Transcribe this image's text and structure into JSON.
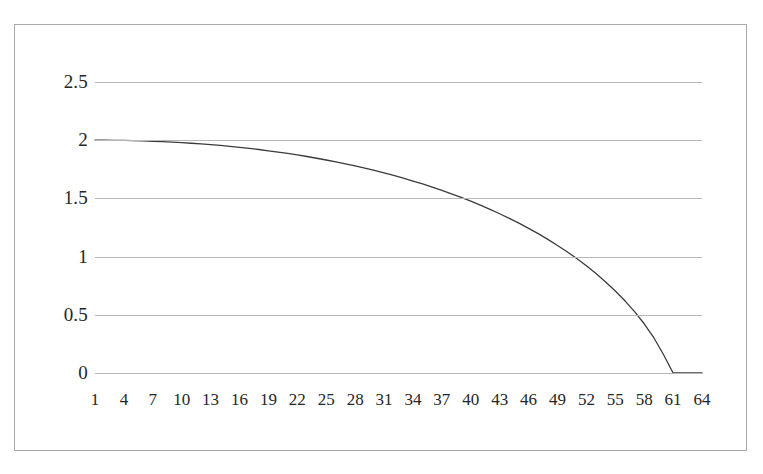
{
  "chart_data": {
    "type": "line",
    "title": "",
    "subtitle": "",
    "xlabel": "",
    "ylabel": "",
    "grid": true,
    "legend": false,
    "legend_position": "none",
    "xlim": [
      1,
      64
    ],
    "ylim": [
      0,
      2.5
    ],
    "y_ticks": [
      "2.5",
      "2",
      "1.5",
      "1",
      "0.5",
      "0"
    ],
    "y_tick_values": [
      2.5,
      2,
      1.5,
      1,
      0.5,
      0
    ],
    "x_ticks": [
      "1",
      "4",
      "7",
      "10",
      "13",
      "16",
      "19",
      "22",
      "25",
      "28",
      "31",
      "34",
      "37",
      "40",
      "43",
      "46",
      "49",
      "52",
      "55",
      "58",
      "61",
      "64"
    ],
    "x_tick_values": [
      1,
      4,
      7,
      10,
      13,
      16,
      19,
      22,
      25,
      28,
      31,
      34,
      37,
      40,
      43,
      46,
      49,
      52,
      55,
      58,
      61,
      64
    ],
    "series": [
      {
        "name": "",
        "color": "#3b3b3b",
        "x": [
          1,
          2,
          3,
          4,
          5,
          6,
          7,
          8,
          9,
          10,
          11,
          12,
          13,
          14,
          15,
          16,
          17,
          18,
          19,
          20,
          21,
          22,
          23,
          24,
          25,
          26,
          27,
          28,
          29,
          30,
          31,
          32,
          33,
          34,
          35,
          36,
          37,
          38,
          39,
          40,
          41,
          42,
          43,
          44,
          45,
          46,
          47,
          48,
          49,
          50,
          51,
          52,
          53,
          54,
          55,
          56,
          57,
          58,
          59,
          60,
          61,
          62,
          63,
          64
        ],
        "values": [
          2.0,
          2.0,
          1.999,
          1.998,
          1.996,
          1.994,
          1.991,
          1.988,
          1.984,
          1.979,
          1.974,
          1.968,
          1.962,
          1.955,
          1.947,
          1.939,
          1.93,
          1.92,
          1.909,
          1.898,
          1.886,
          1.873,
          1.86,
          1.845,
          1.83,
          1.814,
          1.797,
          1.779,
          1.76,
          1.74,
          1.719,
          1.697,
          1.674,
          1.649,
          1.624,
          1.597,
          1.569,
          1.539,
          1.508,
          1.476,
          1.442,
          1.406,
          1.368,
          1.329,
          1.287,
          1.243,
          1.197,
          1.148,
          1.096,
          1.042,
          0.983,
          0.921,
          0.854,
          0.782,
          0.704,
          0.62,
          0.527,
          0.423,
          0.303,
          0.159,
          0.0,
          0.0,
          0.0,
          0.0
        ]
      }
    ]
  },
  "style": {
    "background_color": "#ffffff",
    "frame_border_color": "#a9a9a9",
    "gridline_color": "#b7b7b7",
    "curve_color": "#3b3b3b",
    "label_color": "#262626"
  }
}
